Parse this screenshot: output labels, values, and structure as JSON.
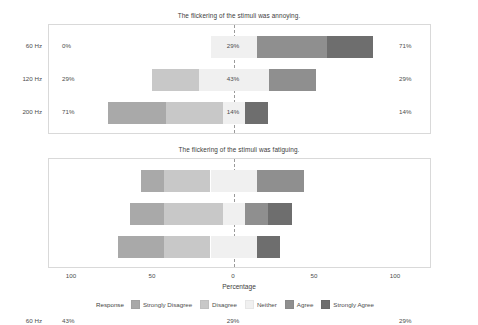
{
  "chart_data": {
    "type": "bar",
    "subtype": "diverging-stacked-likert",
    "title": "",
    "xlabel": "Percentage",
    "ylabel": "",
    "xlim": [
      -100,
      100
    ],
    "xticks": [
      100,
      50,
      0,
      50,
      100
    ],
    "xtick_labels": [
      "100",
      "50",
      "0",
      "50",
      "100"
    ],
    "grid": false,
    "legend": {
      "title": "Response",
      "position": "bottom",
      "entries": [
        {
          "label": "Strongly Disagree",
          "color": "#a9a9a9"
        },
        {
          "label": "Disagree",
          "color": "#c8c8c8"
        },
        {
          "label": "Neither",
          "color": "#f0f0f0"
        },
        {
          "label": "Agree",
          "color": "#8f8f8f"
        },
        {
          "label": "Strongly Agree",
          "color": "#6e6e6e"
        }
      ]
    },
    "categories": [
      "60 Hz",
      "120 Hz",
      "200 Hz"
    ],
    "panels": [
      {
        "title": "The flickering of the stimuli was annoying.",
        "rows": [
          {
            "category": "60 Hz",
            "left_label": "0%",
            "center_label": "29%",
            "right_label": "71%",
            "values": {
              "strongly_disagree": 0,
              "disagree": 0,
              "neither": 29,
              "agree": 43,
              "strongly_agree": 28
            }
          },
          {
            "category": "120 Hz",
            "left_label": "29%",
            "center_label": "43%",
            "right_label": "29%",
            "values": {
              "strongly_disagree": 0,
              "disagree": 29,
              "neither": 43,
              "agree": 29,
              "strongly_agree": 0
            }
          },
          {
            "category": "200 Hz",
            "left_label": "71%",
            "center_label": "14%",
            "right_label": "14%",
            "values": {
              "strongly_disagree": 36,
              "disagree": 35,
              "neither": 14,
              "agree": 0,
              "strongly_agree": 14
            }
          }
        ]
      },
      {
        "title": "The flickering of the stimuli was fatiguing.",
        "rows": [
          {
            "category": "60 Hz",
            "left_label": "43%",
            "center_label": "29%",
            "right_label": "29%",
            "values": {
              "strongly_disagree": 14,
              "disagree": 29,
              "neither": 29,
              "agree": 29,
              "strongly_agree": 0
            }
          },
          {
            "category": "120 Hz",
            "left_label": "57%",
            "center_label": "14%",
            "right_label": "29%",
            "values": {
              "strongly_disagree": 21,
              "disagree": 36,
              "neither": 14,
              "agree": 14,
              "strongly_agree": 15
            }
          },
          {
            "category": "200 Hz",
            "left_label": "57%",
            "center_label": "29%",
            "right_label": "14%",
            "values": {
              "strongly_disagree": 28,
              "disagree": 29,
              "neither": 29,
              "agree": 0,
              "strongly_agree": 14
            }
          }
        ]
      }
    ]
  }
}
